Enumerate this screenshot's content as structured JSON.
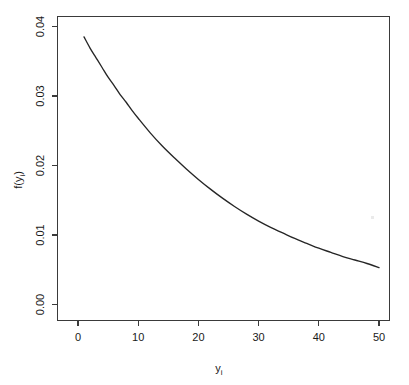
{
  "chart_data": {
    "type": "line",
    "title": "",
    "subtitle": "",
    "xlabel": "y",
    "xlabel_sub": "i",
    "ylabel": "f(y",
    "ylabel_sub": "i",
    "ylabel_close": ")",
    "xlabel_full": "yi",
    "ylabel_full": "f(yi)",
    "xlim": [
      0,
      52
    ],
    "ylim": [
      0.0,
      0.0415
    ],
    "xticks": [
      0,
      10,
      20,
      30,
      40,
      50
    ],
    "xticklabels": [
      "0",
      "10",
      "20",
      "30",
      "40",
      "50"
    ],
    "yticks": [
      0.0,
      0.01,
      0.02,
      0.03,
      0.04
    ],
    "yticklabels": [
      "0.00",
      "0.01",
      "0.02",
      "0.03",
      "0.04"
    ],
    "grid": false,
    "legend": null,
    "legend_position": "none",
    "line_color": "#262626",
    "axis_color": "#3a3a3a",
    "background_color": "#ffffff",
    "series": [
      {
        "name": "f(yi)",
        "x": [
          1,
          2,
          3,
          4,
          5,
          6,
          7,
          8,
          9,
          10,
          12,
          14,
          16,
          18,
          20,
          22,
          24,
          26,
          28,
          30,
          32,
          34,
          36,
          38,
          40,
          42,
          44,
          46,
          48,
          50
        ],
        "values": [
          0.0385,
          0.0369,
          0.0355,
          0.0341,
          0.0327,
          0.0315,
          0.0302,
          0.0291,
          0.0279,
          0.0268,
          0.0247,
          0.0228,
          0.0211,
          0.0195,
          0.018,
          0.0166,
          0.0153,
          0.0141,
          0.013,
          0.012,
          0.0111,
          0.0103,
          0.0095,
          0.0088,
          0.0081,
          0.0075,
          0.0069,
          0.0064,
          0.0059,
          0.0053
        ]
      }
    ]
  },
  "axes": {
    "y_axis_name": "y-axis",
    "x_axis_name": "x-axis"
  }
}
